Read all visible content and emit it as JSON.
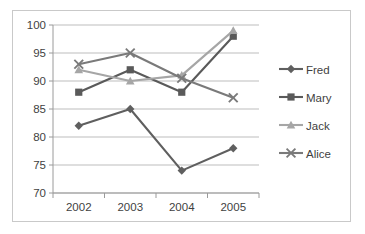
{
  "chart_data": {
    "type": "line",
    "title": "",
    "xlabel": "",
    "ylabel": "",
    "categories": [
      "2002",
      "2003",
      "2004",
      "2005"
    ],
    "ylim": [
      70,
      100
    ],
    "yticks": [
      70,
      75,
      80,
      85,
      90,
      95,
      100
    ],
    "grid": true,
    "legend_position": "right",
    "series": [
      {
        "name": "Fred",
        "marker": "diamond",
        "color": "#5f5f5f",
        "values": [
          82,
          85,
          74,
          78
        ]
      },
      {
        "name": "Mary",
        "marker": "square",
        "color": "#5a5a5a",
        "values": [
          88,
          92,
          88,
          98
        ]
      },
      {
        "name": "Jack",
        "marker": "triangle",
        "color": "#a6a6a6",
        "values": [
          92,
          90,
          91,
          99
        ]
      },
      {
        "name": "Alice",
        "marker": "cross",
        "color": "#7a7a7a",
        "values": [
          93,
          95,
          90.5,
          87
        ]
      }
    ]
  },
  "axis": {
    "ytick_labels": [
      "100",
      "95",
      "90",
      "85",
      "80",
      "75",
      "70"
    ],
    "xtick_labels": [
      "2002",
      "2003",
      "2004",
      "2005"
    ]
  },
  "legend": {
    "entries": [
      {
        "label": "Fred"
      },
      {
        "label": "Mary"
      },
      {
        "label": "Jack"
      },
      {
        "label": "Alice"
      }
    ]
  },
  "colors": {
    "fred": "#5f5f5f",
    "mary": "#5a5a5a",
    "jack": "#a6a6a6",
    "alice": "#7a7a7a",
    "grid": "#b5b5b5",
    "axis": "#9a9a9a",
    "border": "#c9c9c9",
    "text": "#3f3f3f",
    "background": "#ffffff"
  }
}
